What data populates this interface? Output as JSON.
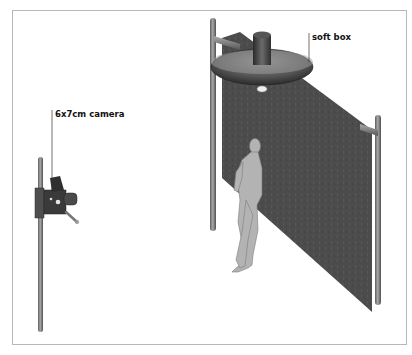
{
  "diagram": {
    "labels": {
      "camera": "6x7cm camera",
      "softbox": "soft box"
    },
    "elements": [
      "camera-stand",
      "6x7cm camera",
      "soft box",
      "backdrop",
      "backdrop-stand-left",
      "backdrop-stand-right",
      "model-figure"
    ]
  },
  "colors": {
    "backdrop": "#4a4a4a",
    "figure": "#b3b3b3",
    "pole": "#7a7a7a",
    "camera": "#3a3a3a",
    "frame_border": "#b8b8b8"
  }
}
